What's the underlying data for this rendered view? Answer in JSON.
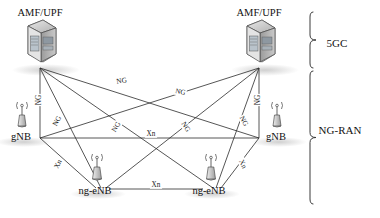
{
  "diagram": {
    "background_color": "#ffffff",
    "line_color": "#2b2b2b"
  },
  "nodes": [
    {
      "id": "amf-upf-left",
      "label": "AMF/UPF",
      "icon": "server-icon",
      "x": 40,
      "y": 42,
      "label_x": 40,
      "label_y": 14,
      "anchor_x": 40,
      "anchor_y": 66
    },
    {
      "id": "amf-upf-right",
      "label": "AMF/UPF",
      "icon": "server-icon",
      "x": 259,
      "y": 42,
      "label_x": 259,
      "label_y": 14,
      "anchor_x": 259,
      "anchor_y": 66
    },
    {
      "id": "gnb-left",
      "label": "gNB",
      "icon": "base-station-icon",
      "x": 20,
      "y": 124,
      "label_x": 20,
      "label_y": 153,
      "anchor_x": 40,
      "anchor_y": 138
    },
    {
      "id": "gnb-right",
      "label": "gNB",
      "icon": "base-station-icon",
      "x": 275,
      "y": 124,
      "label_x": 275,
      "label_y": 153,
      "anchor_x": 259,
      "anchor_y": 138
    },
    {
      "id": "ng-enb-left",
      "label": "ng-eNB",
      "icon": "base-station-icon",
      "x": 93,
      "y": 177,
      "label_x": 93,
      "label_y": 208,
      "anchor_x": 104,
      "anchor_y": 189
    },
    {
      "id": "ng-enb-right",
      "label": "ng-eNB",
      "icon": "base-station-icon",
      "x": 207,
      "y": 177,
      "label_x": 207,
      "label_y": 208,
      "anchor_x": 216,
      "anchor_y": 189
    }
  ],
  "edges": [
    {
      "id": "ng-amfL-gnbL",
      "interface": "NG",
      "from": "amf-upf-left",
      "to": "gnb-left",
      "x1": 40,
      "y1": 68,
      "x2": 40,
      "y2": 138
    },
    {
      "id": "ng-amfL-gnbR",
      "interface": "NG",
      "from": "amf-upf-left",
      "to": "gnb-right",
      "x1": 40,
      "y1": 68,
      "x2": 259,
      "y2": 138
    },
    {
      "id": "ng-amfL-enbL",
      "interface": "NG",
      "from": "amf-upf-left",
      "to": "ng-enb-left",
      "x1": 40,
      "y1": 68,
      "x2": 101,
      "y2": 188
    },
    {
      "id": "ng-amfL-enbR",
      "interface": "NG",
      "from": "amf-upf-left",
      "to": "ng-enb-right",
      "x1": 40,
      "y1": 68,
      "x2": 213,
      "y2": 188
    },
    {
      "id": "ng-amfR-gnbR",
      "interface": "NG",
      "from": "amf-upf-right",
      "to": "gnb-right",
      "x1": 259,
      "y1": 68,
      "x2": 259,
      "y2": 138
    },
    {
      "id": "ng-amfR-gnbL",
      "interface": "NG",
      "from": "amf-upf-right",
      "to": "gnb-left",
      "x1": 259,
      "y1": 68,
      "x2": 40,
      "y2": 138
    },
    {
      "id": "ng-amfR-enbR",
      "interface": "NG",
      "from": "amf-upf-right",
      "to": "ng-enb-right",
      "x1": 259,
      "y1": 68,
      "x2": 216,
      "y2": 188
    },
    {
      "id": "ng-amfR-enbL",
      "interface": "NG",
      "from": "amf-upf-right",
      "to": "ng-enb-left",
      "x1": 259,
      "y1": 68,
      "x2": 106,
      "y2": 188
    },
    {
      "id": "xn-gnbL-gnbR",
      "interface": "Xn",
      "from": "gnb-left",
      "to": "gnb-right",
      "x1": 40,
      "y1": 138,
      "x2": 259,
      "y2": 138
    },
    {
      "id": "xn-gnbL-enbL",
      "interface": "Xn",
      "from": "gnb-left",
      "to": "ng-enb-left",
      "x1": 40,
      "y1": 138,
      "x2": 96,
      "y2": 188
    },
    {
      "id": "xn-gnbR-enbR",
      "interface": "Xn",
      "from": "gnb-right",
      "to": "ng-enb-right",
      "x1": 259,
      "y1": 138,
      "x2": 221,
      "y2": 188
    },
    {
      "id": "xn-enbL-enbR",
      "interface": "Xn",
      "from": "ng-enb-left",
      "to": "ng-enb-right",
      "x1": 109,
      "y1": 189,
      "x2": 203,
      "y2": 189
    }
  ],
  "edge_labels": [
    {
      "id": "lbl-ng-1",
      "text": "NG",
      "x": 122,
      "y": 83,
      "rotate": -9
    },
    {
      "id": "lbl-ng-2",
      "text": "NG",
      "x": 180,
      "y": 94,
      "rotate": 11
    },
    {
      "id": "lbl-ng-3",
      "text": "NG",
      "x": 41,
      "y": 100,
      "rotate": -90
    },
    {
      "id": "lbl-ng-4",
      "text": "NG",
      "x": 59,
      "y": 122,
      "rotate": -62
    },
    {
      "id": "lbl-ng-5",
      "text": "NG",
      "x": 118,
      "y": 128,
      "rotate": -58
    },
    {
      "id": "lbl-ng-6",
      "text": "NG",
      "x": 184,
      "y": 128,
      "rotate": 58
    },
    {
      "id": "lbl-ng-7",
      "text": "NG",
      "x": 242,
      "y": 122,
      "rotate": 62
    },
    {
      "id": "lbl-ng-8",
      "text": "NG",
      "x": 260,
      "y": 100,
      "rotate": -90
    },
    {
      "id": "lbl-xn-1",
      "text": "Xn",
      "x": 151,
      "y": 136,
      "rotate": 0
    },
    {
      "id": "lbl-xn-2",
      "text": "Xn",
      "x": 60,
      "y": 165,
      "rotate": -64
    },
    {
      "id": "lbl-xn-3",
      "text": "Xn",
      "x": 241,
      "y": 165,
      "rotate": 64
    },
    {
      "id": "lbl-xn-4",
      "text": "Xn",
      "x": 156,
      "y": 187,
      "rotate": 0
    }
  ],
  "groups": [
    {
      "id": "group-5gc",
      "label": "5GC",
      "label_x": 337,
      "label_y": 44,
      "brace_top": 12,
      "brace_bottom": 68,
      "brace_x": 310
    },
    {
      "id": "group-ng-ran",
      "label": "NG-RAN",
      "label_x": 337,
      "label_y": 131,
      "brace_top": 71,
      "brace_bottom": 204,
      "brace_x": 310
    }
  ]
}
